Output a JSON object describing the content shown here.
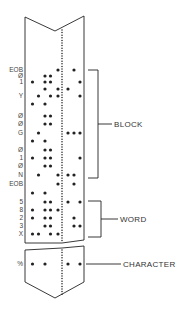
{
  "diagram": {
    "colors": {
      "ink": "#222222",
      "label": "#444444",
      "background": "#ffffff"
    },
    "columns": 7,
    "rows": [
      {
        "label": "EOB",
        "holes": [
          4,
          6
        ]
      },
      {
        "label": "Ø",
        "holes": [
          2,
          3
        ]
      },
      {
        "label": "1",
        "holes": [
          1,
          2,
          3,
          7
        ]
      },
      {
        "label": "",
        "holes": [
          2,
          4,
          5
        ]
      },
      {
        "label": "Y",
        "holes": [
          1.5,
          3,
          4,
          7
        ]
      },
      {
        "label": "",
        "holes": [
          1,
          2
        ]
      },
      {
        "label": "Ø",
        "holes": [
          2,
          3
        ]
      },
      {
        "label": "Ø",
        "holes": [
          2,
          3
        ]
      },
      {
        "label": "G",
        "holes": [
          1.5,
          5,
          6,
          7
        ]
      },
      {
        "label": "",
        "holes": [
          1,
          2
        ]
      },
      {
        "label": "Ø",
        "holes": [
          2,
          3
        ]
      },
      {
        "label": "1",
        "holes": [
          1,
          2,
          3,
          7
        ]
      },
      {
        "label": "Ø",
        "holes": [
          2,
          3
        ]
      },
      {
        "label": "N",
        "holes": [
          1.5,
          4,
          5,
          6
        ]
      },
      {
        "label": "EOB",
        "holes": [
          4,
          6
        ]
      },
      {
        "label": "",
        "holes": [
          1,
          2
        ]
      },
      {
        "label": "5",
        "holes": [
          2,
          3,
          5,
          7
        ]
      },
      {
        "label": "8",
        "holes": [
          1,
          2,
          3,
          4
        ]
      },
      {
        "label": "2",
        "holes": [
          1,
          2,
          3,
          6
        ]
      },
      {
        "label": "3",
        "holes": [
          2,
          3,
          6,
          7
        ]
      },
      {
        "label": "X",
        "holes": [
          1,
          1.5,
          3,
          4
        ]
      }
    ],
    "character_row": {
      "label": "%",
      "holes": [
        1,
        2,
        5,
        7
      ]
    },
    "brackets": [
      {
        "name": "block",
        "label": "BLOCK",
        "from_row": 0,
        "to_row": 14
      },
      {
        "name": "word",
        "label": "WORD",
        "from_row": 16,
        "to_row": 20
      },
      {
        "name": "character",
        "label": "CHARACTER"
      }
    ]
  }
}
